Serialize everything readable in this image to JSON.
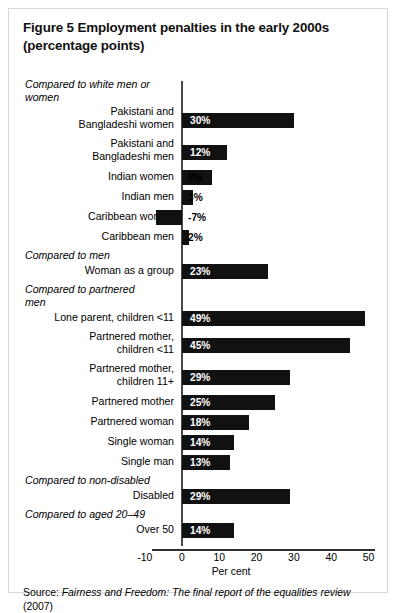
{
  "figure": {
    "title_line1": "Figure 5 Employment penalties in the early 2000s",
    "title_line2": "(percentage points)",
    "source_prefix": "Source:",
    "source_italic": "Fairness and Freedom: The final report of the equalities review",
    "source_suffix": "(2007)"
  },
  "chart_data": {
    "type": "bar",
    "orientation": "horizontal",
    "title": "Figure 5 Employment penalties in the early 2000s (percentage points)",
    "xlabel": "Per cent",
    "ylabel": "",
    "xlim": [
      -10,
      50
    ],
    "xticks": [
      -10,
      0,
      10,
      20,
      30,
      40,
      50
    ],
    "xtick_labels": [
      "-10",
      "0",
      "10",
      "20",
      "30",
      "40",
      "50"
    ],
    "grid": false,
    "legend": false,
    "bar_color": "#111111",
    "value_suffix": "%",
    "groups": [
      {
        "heading": "Compared to white men or women",
        "categories": [
          "Pakistani and Bangladeshi women",
          "Pakistani and Bangladeshi men",
          "Indian women",
          "Indian men",
          "Caribbean women",
          "Caribbean men"
        ],
        "values": [
          30,
          12,
          8,
          3,
          -7,
          2
        ],
        "labels": [
          "30%",
          "12%",
          "8%",
          "3%",
          "-7%",
          "2%"
        ]
      },
      {
        "heading": "Compared to men",
        "categories": [
          "Woman as a group"
        ],
        "values": [
          23
        ],
        "labels": [
          "23%"
        ]
      },
      {
        "heading": "Compared to partnered men",
        "categories": [
          "Lone parent, children <11",
          "Partnered mother, children <11",
          "Partnered mother, children 11+",
          "Partnered mother",
          "Partnered woman",
          "Single woman",
          "Single man"
        ],
        "values": [
          49,
          45,
          29,
          25,
          18,
          14,
          13
        ],
        "labels": [
          "49%",
          "45%",
          "29%",
          "25%",
          "18%",
          "14%",
          "13%"
        ]
      },
      {
        "heading": "Compared to non-disabled",
        "categories": [
          "Disabled"
        ],
        "values": [
          29
        ],
        "labels": [
          "29%"
        ]
      },
      {
        "heading": "Compared to aged 20–49",
        "categories": [
          "Over 50"
        ],
        "values": [
          14
        ],
        "labels": [
          "14%"
        ]
      }
    ]
  },
  "rows": [
    {
      "kind": "head",
      "text": "Compared to white men or",
      "text2": "women"
    },
    {
      "kind": "bar",
      "label": "Pakistani and",
      "label2": "Bangladeshi women",
      "value": 30,
      "label_text": "30%"
    },
    {
      "kind": "bar",
      "label": "Pakistani and",
      "label2": "Bangladeshi men",
      "value": 12,
      "label_text": "12%"
    },
    {
      "kind": "bar",
      "label": "Indian women",
      "value": 8,
      "label_text": "8%"
    },
    {
      "kind": "bar",
      "label": "Indian men",
      "value": 3,
      "label_text": "3%"
    },
    {
      "kind": "bar",
      "label": "Caribbean women",
      "value": -7,
      "label_text": "-7%"
    },
    {
      "kind": "bar",
      "label": "Caribbean men",
      "value": 2,
      "label_text": "2%"
    },
    {
      "kind": "head",
      "text": "Compared to men"
    },
    {
      "kind": "bar",
      "label": "Woman as a group",
      "value": 23,
      "label_text": "23%"
    },
    {
      "kind": "head",
      "text": "Compared to partnered",
      "text2": "men"
    },
    {
      "kind": "bar",
      "label": "Lone parent, children <11",
      "value": 49,
      "label_text": "49%"
    },
    {
      "kind": "bar",
      "label": "Partnered mother,",
      "label2": "children <11",
      "value": 45,
      "label_text": "45%"
    },
    {
      "kind": "bar",
      "label": "Partnered mother,",
      "label2": "children 11+",
      "value": 29,
      "label_text": "29%"
    },
    {
      "kind": "bar",
      "label": "Partnered mother",
      "value": 25,
      "label_text": "25%"
    },
    {
      "kind": "bar",
      "label": "Partnered woman",
      "value": 18,
      "label_text": "18%"
    },
    {
      "kind": "bar",
      "label": "Single woman",
      "value": 14,
      "label_text": "14%"
    },
    {
      "kind": "bar",
      "label": "Single man",
      "value": 13,
      "label_text": "13%"
    },
    {
      "kind": "head",
      "text": "Compared to non-disabled"
    },
    {
      "kind": "bar",
      "label": "Disabled",
      "value": 29,
      "label_text": "29%"
    },
    {
      "kind": "head",
      "text": "Compared to aged 20–49"
    },
    {
      "kind": "bar",
      "label": "Over 50",
      "value": 14,
      "label_text": "14%"
    }
  ],
  "axis": {
    "ticks": [
      "-10",
      "0",
      "10",
      "20",
      "30",
      "40",
      "50"
    ],
    "title": "Per cent"
  }
}
